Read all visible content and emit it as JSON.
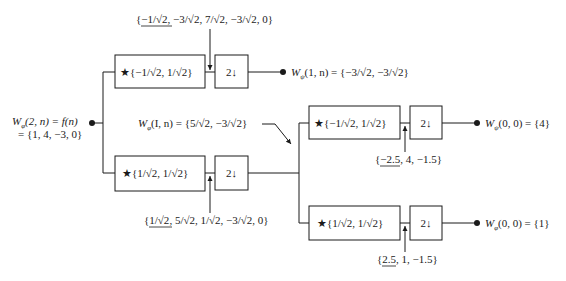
{
  "diagram": {
    "input": {
      "line1": "W_φ(2, n) = f(n)",
      "line1_symbol": "W",
      "line1_sub": "φ",
      "line1_args": "(2, n) = f(n)",
      "line2": "= {1, 4, −3, 0}"
    },
    "stage1": {
      "highpass_filter_label": "★{−1/√2, 1/√2}",
      "lowpass_filter_label": "★{1/√2, 1/√2}",
      "downsample_label": "2↓",
      "highpass_conv_output": "{−1/√2, −3/√2, 7/√2, −3/√2, 0}",
      "highpass_conv_underlined": "−1/√2",
      "highpass_conv_rest": ", −3/√2, 7/√2, −3/√2, 0}",
      "lowpass_conv_output": "{1/√2, 5/√2, 1/√2, −3/√2, 0}",
      "lowpass_conv_underlined": "1/√2",
      "lowpass_conv_rest": ", 5/√2, 1/√2, −3/√2, 0}",
      "highpass_output": "W_ψ(1, n) = {−3/√2, −3/√2}",
      "highpass_output_sub": "ψ",
      "highpass_output_args": "(1, n) = {−3/√2, −3/√2}",
      "lowpass_output": "W_φ(I, n) = {5/√2, −3/√2}",
      "lowpass_output_sub": "φ",
      "lowpass_output_args": "(I, n) = {5/√2, −3/√2}"
    },
    "stage2": {
      "highpass_filter_label": "★{−1/√2, 1/√2}",
      "lowpass_filter_label": "★{1/√2, 1/√2}",
      "downsample_label": "2↓",
      "highpass_conv_output": "{−2.5, 4, −1.5}",
      "highpass_conv_underlined": "−2.5",
      "highpass_conv_rest": ", 4, −1.5}",
      "lowpass_conv_output": "{2.5, 1, −1.5}",
      "lowpass_conv_underlined": "2.5",
      "lowpass_conv_rest": ", 1, −1.5}",
      "highpass_output": "W_ψ(0, 0) = {4}",
      "highpass_output_sub": "ψ",
      "highpass_output_args": "(0, 0) = {4}",
      "lowpass_output": "W_φ(0, 0) = {1}",
      "lowpass_output_sub": "φ",
      "lowpass_output_args": "(0, 0) = {1}"
    },
    "common": {
      "W": "W",
      "open_brace": "{"
    },
    "colors": {
      "ink": "#1a1a1a",
      "background": "#ffffff"
    }
  }
}
